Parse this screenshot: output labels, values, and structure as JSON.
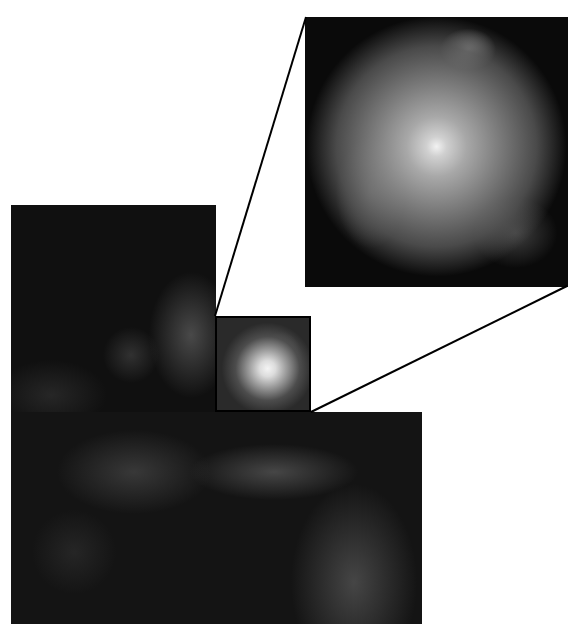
{
  "figure": {
    "main_image": {
      "shape": "staircase mosaic",
      "upper_block": {
        "x": 11,
        "y": 205,
        "width": 205,
        "height": 208
      },
      "lower_block": {
        "x": 14,
        "y": 412,
        "width": 408,
        "height": 212
      }
    },
    "core_highlight_box": {
      "x": 215,
      "y": 316,
      "width": 96,
      "height": 96
    },
    "zoom_inset": {
      "x": 305,
      "y": 17,
      "width": 263,
      "height": 270
    },
    "connector_lines": [
      {
        "from": [
          215,
          316
        ],
        "to": [
          306,
          17
        ]
      },
      {
        "from": [
          311,
          412
        ],
        "to": [
          567,
          286
        ]
      }
    ],
    "colors": {
      "background": "#ffffff",
      "frame": "#000000",
      "sky": "#101010",
      "core": "#f4f4f4"
    }
  }
}
